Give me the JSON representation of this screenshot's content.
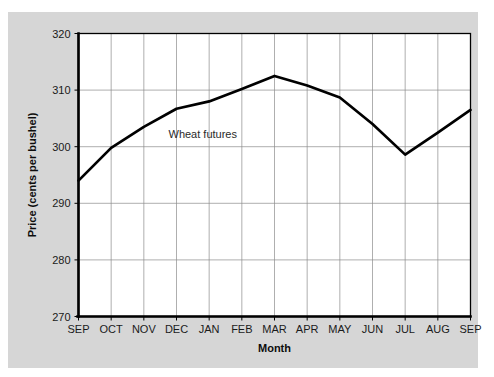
{
  "chart_data": {
    "type": "line",
    "title": "",
    "subtitle": "",
    "xlabel": "Month",
    "ylabel": "Price (cents per bushel)",
    "categories": [
      "SEP",
      "OCT",
      "NOV",
      "DEC",
      "JAN",
      "FEB",
      "MAR",
      "APR",
      "MAY",
      "JUN",
      "JUL",
      "AUG",
      "SEP"
    ],
    "series": [
      {
        "name": "Wheat futures",
        "values": [
          294.0,
          299.8,
          303.5,
          306.7,
          308.0,
          310.2,
          312.5,
          310.8,
          308.7,
          304.0,
          298.6,
          302.5,
          306.5
        ]
      }
    ],
    "ylim": [
      270,
      320
    ],
    "yticks": [
      270,
      280,
      290,
      300,
      310,
      320
    ],
    "ytick_labels": [
      "270",
      "280",
      "290",
      "300",
      "310",
      "320"
    ],
    "grid": true,
    "grid_x": true,
    "grid_y": true,
    "legend": false,
    "legend_position": "none",
    "annotations": [
      {
        "text": "Wheat futures",
        "x_category": "DEC",
        "value": 301.5
      }
    ],
    "line_color": "#000000",
    "plot_background": "#ffffff",
    "figure_background": "#d6d6d6",
    "gridline_color": "#8d8d8d"
  }
}
